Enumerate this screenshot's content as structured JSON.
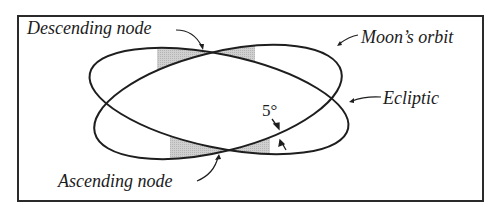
{
  "diagram": {
    "type": "orbital-geometry",
    "labels": {
      "descending_node": "Descending node",
      "ascending_node": "Ascending node",
      "moons_orbit": "Moon’s orbit",
      "ecliptic": "Ecliptic",
      "inclination": "5°"
    },
    "nodes": [
      {
        "name": "Descending node",
        "x": 205,
        "y": 53
      },
      {
        "name": "Ascending node",
        "x": 222,
        "y": 151
      }
    ],
    "curves": [
      {
        "name": "Moon’s orbit",
        "center": [
          218,
          102
        ],
        "rx": 127,
        "ry": 49.5,
        "rotation_deg": -14
      },
      {
        "name": "Ecliptic",
        "center": [
          219,
          101
        ],
        "rx": 132,
        "ry": 46.5,
        "rotation_deg": 12
      }
    ],
    "colors": {
      "line": "#1e1e1e",
      "shade": "#c8c8c8",
      "frame": "#2a2a2a",
      "background": "#ffffff"
    }
  }
}
